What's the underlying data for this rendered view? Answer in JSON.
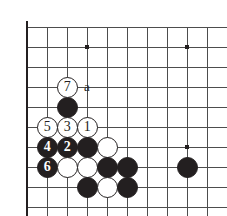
{
  "figure": {
    "kind": "go-board-diagram",
    "width": 227,
    "height": 216,
    "background": "#ffffff"
  },
  "board": {
    "origin_x": 27,
    "origin_y": 27,
    "spacing": 20,
    "cols": 10,
    "rows": 9,
    "line_color": "#4d4d4d",
    "edge_color": "#231f20",
    "edge_width": 2.6,
    "line_width": 1,
    "stone_radius": 10.5,
    "star_points": [
      {
        "col": 3,
        "row": 1
      },
      {
        "col": 8,
        "row": 1
      },
      {
        "col": 8,
        "row": 6
      }
    ]
  },
  "stones": [
    {
      "col": 2,
      "row": 4,
      "color": "black",
      "label": ""
    },
    {
      "col": 1,
      "row": 5,
      "color": "white",
      "label": "5"
    },
    {
      "col": 2,
      "row": 5,
      "color": "white",
      "label": "3"
    },
    {
      "col": 3,
      "row": 5,
      "color": "white",
      "label": "1"
    },
    {
      "col": 1,
      "row": 6,
      "color": "black",
      "label": "4"
    },
    {
      "col": 2,
      "row": 6,
      "color": "black",
      "label": "2"
    },
    {
      "col": 3,
      "row": 6,
      "color": "black",
      "label": ""
    },
    {
      "col": 4,
      "row": 6,
      "color": "white",
      "label": ""
    },
    {
      "col": 1,
      "row": 7,
      "color": "black",
      "label": "6"
    },
    {
      "col": 2,
      "row": 7,
      "color": "white",
      "label": ""
    },
    {
      "col": 3,
      "row": 7,
      "color": "white",
      "label": ""
    },
    {
      "col": 4,
      "row": 7,
      "color": "black",
      "label": ""
    },
    {
      "col": 5,
      "row": 7,
      "color": "black",
      "label": ""
    },
    {
      "col": 3,
      "row": 8,
      "color": "black",
      "label": ""
    },
    {
      "col": 4,
      "row": 8,
      "color": "white",
      "label": ""
    },
    {
      "col": 5,
      "row": 8,
      "color": "black",
      "label": ""
    },
    {
      "col": 2,
      "row": 3,
      "color": "white",
      "label": "7"
    },
    {
      "col": 8,
      "row": 7,
      "color": "black",
      "label": ""
    }
  ],
  "markers": [
    {
      "col": 3,
      "row": 3,
      "text": "a"
    }
  ]
}
